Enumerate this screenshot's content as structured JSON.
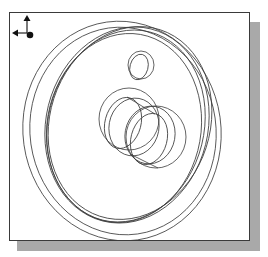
{
  "figure": {
    "type": "cad-viewport",
    "colors": {
      "line": "#3c3c3c",
      "frame": "#3a3a3a",
      "shadow": "#a9a9a9",
      "background": "#ffffff"
    },
    "outer_rings": [
      {
        "cx": 112,
        "cy": 118,
        "rx": 99,
        "ry": 110,
        "rot": -8
      },
      {
        "cx": 113,
        "cy": 118,
        "rx": 93,
        "ry": 104,
        "rot": -8
      },
      {
        "cx": 117,
        "cy": 112,
        "rx": 81,
        "ry": 99,
        "rot": 14
      },
      {
        "cx": 116,
        "cy": 113,
        "rx": 78,
        "ry": 97,
        "rot": 14
      },
      {
        "cx": 114,
        "cy": 115,
        "rx": 77,
        "ry": 95,
        "rot": 10
      },
      {
        "cx": 120,
        "cy": 110,
        "rx": 80,
        "ry": 98,
        "rot": 18
      }
    ],
    "small_hole": [
      {
        "cx": 131,
        "cy": 52,
        "rx": 13,
        "ry": 14,
        "rot": 0
      },
      {
        "cx": 129,
        "cy": 54,
        "rx": 9,
        "ry": 13,
        "rot": 15
      }
    ],
    "center_hub": [
      {
        "cx": 119,
        "cy": 106,
        "rx": 30,
        "ry": 31,
        "rot": 0
      },
      {
        "cx": 113,
        "cy": 110,
        "rx": 18,
        "ry": 26,
        "rot": 15
      },
      {
        "cx": 146,
        "cy": 124,
        "rx": 30,
        "ry": 31,
        "rot": 0
      },
      {
        "cx": 139,
        "cy": 126,
        "rx": 18,
        "ry": 26,
        "rot": 15
      },
      {
        "cx": 124,
        "cy": 114,
        "rx": 25,
        "ry": 29,
        "rot": 10
      },
      {
        "cx": 140,
        "cy": 122,
        "rx": 25,
        "ry": 29,
        "rot": 10
      }
    ],
    "hub_tangents": [
      {
        "x1": 117,
        "y1": 84,
        "x2": 145,
        "y2": 101
      },
      {
        "x1": 120,
        "y1": 141,
        "x2": 148,
        "y2": 155
      }
    ],
    "triad": {
      "axes": [
        "up-arrow",
        "left-arrow",
        "out-of-plane-dot"
      ]
    }
  }
}
